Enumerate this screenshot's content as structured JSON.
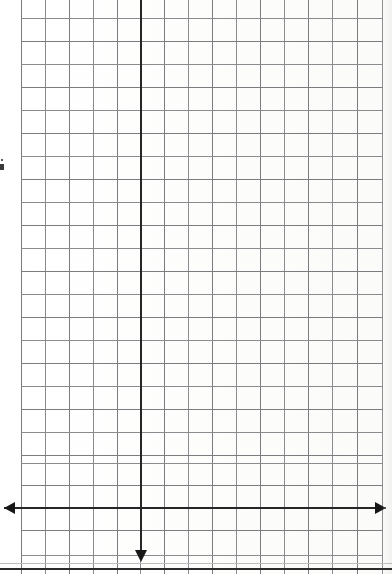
{
  "document": {
    "title": "Blank Graph Paper Scan",
    "description": "Scanned sheet of quadrille graph paper with a hand-drawn cartesian axis pair",
    "background_color": "#fefefe"
  },
  "chart_data": {
    "type": "scatter",
    "title": "",
    "subtitle": "",
    "xlabel": "",
    "ylabel": "",
    "series": [],
    "values": [],
    "categories": [],
    "annotations": [],
    "legend": {
      "entries": [],
      "position": "none"
    },
    "grid": {
      "visible": true,
      "color": "#7b7c7f",
      "minor_color": "#8a8b8e",
      "cell_size_px": 24.1,
      "vertical_line_count": 16,
      "horizontal_line_count": 24,
      "left_px": 21,
      "right_px": 382,
      "top_px": 18,
      "bottom_px": 555
    },
    "axes": {
      "x_axis": {
        "name": "horizontal-axis",
        "y_px": 507,
        "x_start_px": 4,
        "x_end_px": 386,
        "color": "#262626",
        "thickness_px": 2,
        "arrow_start": true,
        "arrow_end": true,
        "tick_labels": [],
        "range_shown": []
      },
      "y_axis": {
        "name": "vertical-axis",
        "x_px": 140,
        "y_start_px": 0,
        "y_end_px": 550,
        "color": "#262626",
        "thickness_px": 2,
        "arrow_start": false,
        "arrow_end": true,
        "arrow_direction": "down",
        "tick_labels": [],
        "range_shown": []
      }
    },
    "xlim": [],
    "ylim": []
  },
  "scan": {
    "bottom_border_color": "#2b2b2b",
    "bottom_border_y_px": 568,
    "bottom_soft_line_y_px": 563,
    "edge_mark_label": "page-edge-artifact",
    "edge_mark_x_px": 0,
    "edge_mark_y_px": 164
  },
  "grid_lines": {
    "vertical_x": [
      21,
      45,
      69,
      93,
      117,
      140,
      164,
      188,
      212,
      236,
      260,
      284,
      308,
      332,
      357,
      382
    ],
    "horizontal_y": [
      18,
      41,
      64,
      87,
      110,
      133,
      156,
      179,
      202,
      225,
      248,
      271,
      294,
      317,
      340,
      363,
      386,
      409,
      432,
      455,
      463,
      485,
      507,
      530,
      555
    ]
  }
}
